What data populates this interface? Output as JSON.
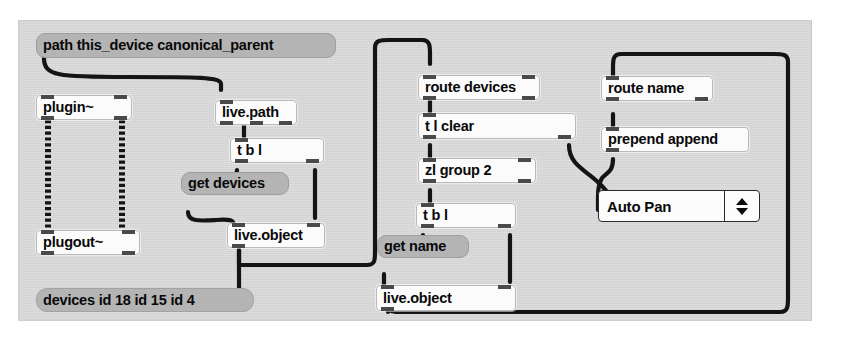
{
  "patcher": {
    "title": "Max patcher canvas",
    "background_color": "#d8d8d8",
    "cord_color": "#141414",
    "object_box_color": "#fbfbfb",
    "message_box_color": "#b4b4b4"
  },
  "objects": {
    "path_msg": {
      "text": "path this_device canonical_parent",
      "kind": "message"
    },
    "plugin": {
      "text": "plugin~",
      "kind": "object"
    },
    "plugout": {
      "text": "plugout~",
      "kind": "object"
    },
    "live_path": {
      "text": "live.path",
      "kind": "object"
    },
    "tbl_left": {
      "text": "t b l",
      "kind": "object"
    },
    "get_devices": {
      "text": "get devices",
      "kind": "message"
    },
    "live_object_left": {
      "text": "live.object",
      "kind": "object"
    },
    "devices_comment": {
      "text": "devices id 18 id 15 id 4",
      "kind": "comment"
    },
    "route_devices": {
      "text": "route devices",
      "kind": "object"
    },
    "t_l_clear": {
      "text": "t l clear",
      "kind": "object"
    },
    "zl_group": {
      "text": "zl group 2",
      "kind": "object"
    },
    "tbl_mid": {
      "text": "t b l",
      "kind": "object"
    },
    "get_name": {
      "text": "get name",
      "kind": "message"
    },
    "live_object_mid": {
      "text": "live.object",
      "kind": "object"
    },
    "route_name": {
      "text": "route name",
      "kind": "object"
    },
    "prepend_append": {
      "text": "prepend append",
      "kind": "object"
    },
    "umenu": {
      "value": "Auto Pan",
      "kind": "umenu",
      "up_arrow": "▲",
      "down_arrow": "▼"
    }
  }
}
